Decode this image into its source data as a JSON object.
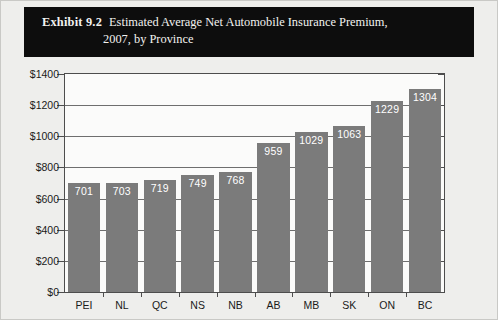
{
  "header": {
    "exhibit_label": "Exhibit 9.2",
    "title_line1": "Estimated Average Net Automobile Insurance Premium,",
    "title_line2": "2007, by Province"
  },
  "colors": {
    "header_background": "#0d0d0d",
    "header_text": "#f2f2f0",
    "bar_fill": "#7b7b7b",
    "bar_label_text": "#ffffff",
    "axis_line": "#4d4d4d",
    "gridline": "#6e6e6e",
    "plot_background": "#fbfbfa",
    "figure_background": "#eeeeec"
  },
  "chart_data": {
    "type": "bar",
    "xlabel": "",
    "ylabel": "",
    "ylim": [
      0,
      1400
    ],
    "ytick_values": [
      0,
      200,
      400,
      600,
      800,
      1000,
      1200,
      1400
    ],
    "ytick_labels": [
      "$0",
      "$200",
      "$400",
      "$600",
      "$800",
      "$1000",
      "$1200",
      "$1400"
    ],
    "grid": true,
    "legend": false,
    "categories": [
      "PEI",
      "NL",
      "QC",
      "NS",
      "NB",
      "AB",
      "MB",
      "SK",
      "ON",
      "BC"
    ],
    "values": [
      701,
      703,
      719,
      749,
      768,
      959,
      1029,
      1063,
      1229,
      1304
    ],
    "value_labels": [
      "701",
      "703",
      "719",
      "749",
      "768",
      "959",
      "1029",
      "1063",
      "1229",
      "1304"
    ]
  }
}
